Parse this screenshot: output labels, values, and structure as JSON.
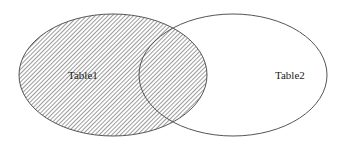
{
  "diagram": {
    "type": "venn",
    "sets": [
      {
        "label": "Table1",
        "shaded": true
      },
      {
        "label": "Table2",
        "shaded": false
      }
    ],
    "colors": {
      "stroke": "#555555",
      "hatch": "#666666",
      "background": "#ffffff",
      "text": "#222222"
    }
  }
}
